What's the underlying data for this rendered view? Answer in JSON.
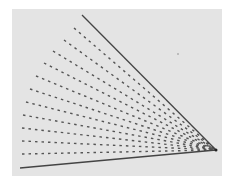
{
  "figure": {
    "colors": {
      "background": "#ffffff",
      "panel": "#e4e4e4",
      "line": "#444444",
      "dash": "#555555"
    },
    "vertex": [
      216,
      150
    ],
    "top_line": {
      "from": [
        82,
        15
      ],
      "to": [
        216,
        150
      ]
    },
    "bottom_line": {
      "from": [
        20,
        168
      ],
      "to": [
        216,
        150
      ]
    },
    "rays": [
      [
        74,
        28
      ],
      [
        64,
        40
      ],
      [
        53,
        51
      ],
      [
        44,
        63
      ],
      [
        36,
        76
      ],
      [
        30,
        89
      ],
      [
        26,
        102
      ],
      [
        23,
        115
      ],
      [
        22,
        128
      ],
      [
        22,
        141
      ],
      [
        22,
        154
      ]
    ],
    "stray_dot": [
      178,
      54
    ]
  }
}
